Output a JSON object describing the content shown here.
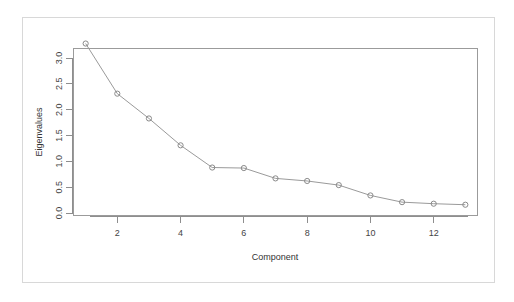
{
  "chart_data": {
    "type": "line",
    "title": "",
    "xlabel": "Component",
    "ylabel": "Eigenvalues",
    "x": [
      1,
      2,
      3,
      4,
      5,
      6,
      7,
      8,
      9,
      10,
      11,
      12,
      13
    ],
    "values": [
      3.28,
      2.31,
      1.83,
      1.31,
      0.88,
      0.87,
      0.67,
      0.62,
      0.54,
      0.34,
      0.21,
      0.18,
      0.16
    ],
    "series": [
      {
        "name": "Eigenvalues",
        "values": [
          3.28,
          2.31,
          1.83,
          1.31,
          0.88,
          0.87,
          0.67,
          0.62,
          0.54,
          0.34,
          0.21,
          0.18,
          0.16
        ]
      }
    ],
    "xlim": [
      0.6,
      13.4
    ],
    "ylim": [
      0.0,
      3.35
    ],
    "xticks": [
      2,
      4,
      6,
      8,
      10,
      12
    ],
    "xtick_labels": [
      "2",
      "4",
      "6",
      "8",
      "10",
      "12"
    ],
    "yticks": [
      0.0,
      0.5,
      1.0,
      1.5,
      2.0,
      2.5,
      3.0
    ],
    "ytick_labels": [
      "0.0",
      "0.5",
      "1.0",
      "1.5",
      "2.0",
      "2.5",
      "3.0"
    ],
    "grid": false,
    "legend": false,
    "marker": "open-circle",
    "line_color": "#9a9a9a",
    "marker_color": "#8a8a8a",
    "axis_color": "#8e8e8e",
    "background": "#ffffff"
  },
  "figure": {
    "frame_color": "#d8d8d8",
    "plot_box_color": "#9b9b9b"
  }
}
